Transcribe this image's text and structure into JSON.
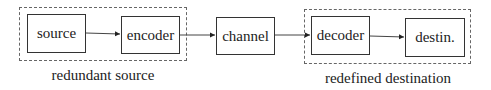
{
  "diagram": {
    "type": "block-diagram",
    "nodes": [
      {
        "id": "source",
        "label": "source"
      },
      {
        "id": "encoder",
        "label": "encoder"
      },
      {
        "id": "channel",
        "label": "channel"
      },
      {
        "id": "decoder",
        "label": "decoder"
      },
      {
        "id": "destination",
        "label": "destin."
      }
    ],
    "edges": [
      {
        "from": "source",
        "to": "encoder"
      },
      {
        "from": "encoder",
        "to": "channel"
      },
      {
        "from": "channel",
        "to": "decoder"
      },
      {
        "from": "decoder",
        "to": "destination"
      }
    ],
    "groups": [
      {
        "id": "redundant-source",
        "label": "redundant source",
        "members": [
          "source",
          "encoder"
        ]
      },
      {
        "id": "redefined-destination",
        "label": "redefined destination",
        "members": [
          "decoder",
          "destination"
        ]
      }
    ]
  }
}
